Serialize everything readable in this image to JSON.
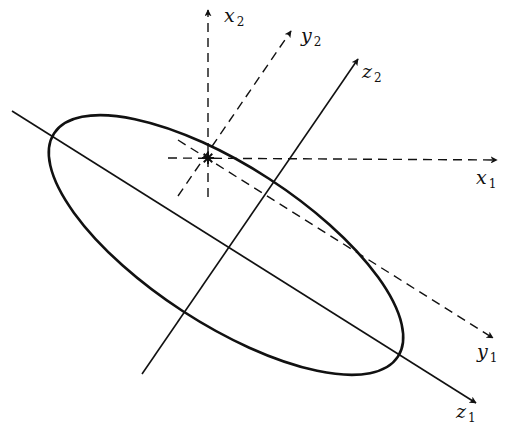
{
  "diagram": {
    "type": "coordinate-frames-with-ellipse",
    "colors": {
      "stroke": "#111111",
      "background": "#ffffff"
    },
    "origin_marker": {
      "symbol": "asterisk",
      "x": 208,
      "y": 158
    },
    "ellipse": {
      "cx": 226,
      "cy": 245,
      "rx": 205,
      "ry": 79,
      "rotation_deg": 33,
      "style": "solid"
    },
    "axes": [
      {
        "id": "x1",
        "label": "x",
        "sub": "1",
        "style": "dashed",
        "from": [
          168,
          158
        ],
        "to": [
          497,
          160
        ],
        "label_pos": [
          476,
          184
        ]
      },
      {
        "id": "x2",
        "label": "x",
        "sub": "2",
        "style": "dashed",
        "from": [
          208,
          197
        ],
        "to": [
          208,
          10
        ],
        "label_pos": [
          224,
          22
        ]
      },
      {
        "id": "y1",
        "label": "y",
        "sub": "1",
        "style": "dashed",
        "from": [
          178,
          140
        ],
        "to": [
          493,
          338
        ],
        "label_pos": [
          477,
          358
        ]
      },
      {
        "id": "y2",
        "label": "y",
        "sub": "2",
        "style": "dashed",
        "from": [
          178,
          196
        ],
        "to": [
          291,
          31
        ],
        "label_pos": [
          301,
          42
        ]
      },
      {
        "id": "z1",
        "label": "z",
        "sub": "1",
        "style": "solid",
        "from": [
          12,
          111
        ],
        "to": [
          476,
          403
        ],
        "label_pos": [
          456,
          418
        ]
      },
      {
        "id": "z2",
        "label": "z",
        "sub": "2",
        "style": "solid",
        "from": [
          142,
          374
        ],
        "to": [
          358,
          59
        ],
        "label_pos": [
          362,
          78
        ]
      }
    ]
  }
}
